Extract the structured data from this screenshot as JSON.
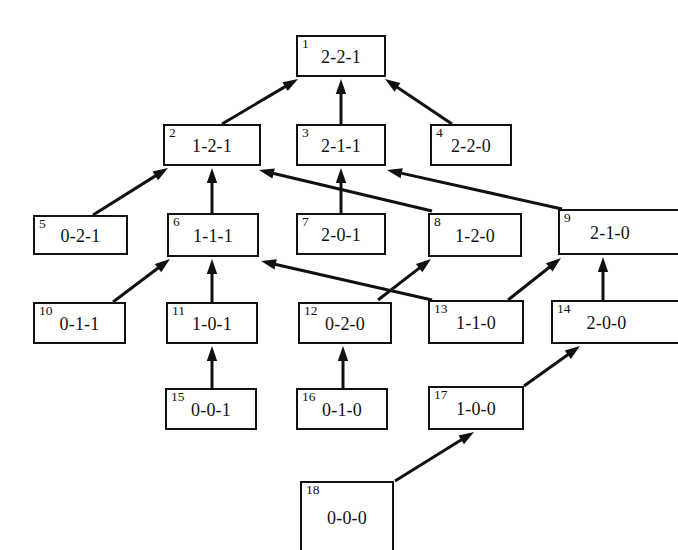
{
  "diagram": {
    "type": "directed-acyclic-graph",
    "node_colors": {
      "border": "#111111",
      "fill": "#ffffff",
      "text": "#111111"
    },
    "edge_color": "#111111",
    "nodes": [
      {
        "id": "1",
        "label": "2-2-1",
        "x": 296,
        "y": 35,
        "w": 90,
        "h": 42,
        "clip": ""
      },
      {
        "id": "2",
        "label": "1-2-1",
        "x": 163,
        "y": 124,
        "w": 98,
        "h": 42,
        "clip": ""
      },
      {
        "id": "3",
        "label": "2-1-1",
        "x": 296,
        "y": 124,
        "w": 90,
        "h": 42,
        "clip": ""
      },
      {
        "id": "4",
        "label": "2-2-0",
        "x": 430,
        "y": 124,
        "w": 82,
        "h": 42,
        "clip": ""
      },
      {
        "id": "5",
        "label": "0-2-1",
        "x": 33,
        "y": 215,
        "w": 95,
        "h": 40,
        "clip": ""
      },
      {
        "id": "6",
        "label": "1-1-1",
        "x": 167,
        "y": 213,
        "w": 92,
        "h": 44,
        "clip": ""
      },
      {
        "id": "7",
        "label": "2-0-1",
        "x": 296,
        "y": 213,
        "w": 90,
        "h": 42,
        "clip": ""
      },
      {
        "id": "8",
        "label": "1-2-0",
        "x": 428,
        "y": 213,
        "w": 94,
        "h": 44,
        "clip": ""
      },
      {
        "id": "9",
        "label": "2-1-0",
        "x": 558,
        "y": 209,
        "w": 120,
        "h": 46,
        "clip": "clip-right"
      },
      {
        "id": "10",
        "label": "0-1-1",
        "x": 33,
        "y": 302,
        "w": 93,
        "h": 42,
        "clip": ""
      },
      {
        "id": "11",
        "label": "1-0-1",
        "x": 166,
        "y": 302,
        "w": 92,
        "h": 42,
        "clip": ""
      },
      {
        "id": "12",
        "label": "0-2-0",
        "x": 298,
        "y": 302,
        "w": 94,
        "h": 42,
        "clip": ""
      },
      {
        "id": "13",
        "label": "1-1-0",
        "x": 428,
        "y": 300,
        "w": 96,
        "h": 44,
        "clip": ""
      },
      {
        "id": "14",
        "label": "2-0-0",
        "x": 551,
        "y": 300,
        "w": 127,
        "h": 44,
        "clip": "clip-right"
      },
      {
        "id": "15",
        "label": "0-0-1",
        "x": 165,
        "y": 388,
        "w": 92,
        "h": 42,
        "clip": ""
      },
      {
        "id": "16",
        "label": "0-1-0",
        "x": 296,
        "y": 388,
        "w": 92,
        "h": 42,
        "clip": ""
      },
      {
        "id": "17",
        "label": "1-0-0",
        "x": 428,
        "y": 386,
        "w": 96,
        "h": 44,
        "clip": ""
      },
      {
        "id": "18",
        "label": "0-0-0",
        "x": 300,
        "y": 481,
        "w": 94,
        "h": 69,
        "clip": "clip-bottom"
      }
    ],
    "edges": [
      {
        "from": "2",
        "to": "1",
        "x1": 222,
        "y1": 124,
        "x2": 298,
        "y2": 79
      },
      {
        "from": "3",
        "to": "1",
        "x1": 341,
        "y1": 124,
        "x2": 341,
        "y2": 79
      },
      {
        "from": "4",
        "to": "1",
        "x1": 452,
        "y1": 124,
        "x2": 385,
        "y2": 79
      },
      {
        "from": "5",
        "to": "2",
        "x1": 93,
        "y1": 215,
        "x2": 168,
        "y2": 168
      },
      {
        "from": "6",
        "to": "2",
        "x1": 212,
        "y1": 213,
        "x2": 212,
        "y2": 168
      },
      {
        "from": "8",
        "to": "2",
        "x1": 432,
        "y1": 211,
        "x2": 259,
        "y2": 170
      },
      {
        "from": "7",
        "to": "3",
        "x1": 341,
        "y1": 213,
        "x2": 341,
        "y2": 168
      },
      {
        "from": "9",
        "to": "3",
        "x1": 562,
        "y1": 209,
        "x2": 387,
        "y2": 170
      },
      {
        "from": "10",
        "to": "6",
        "x1": 113,
        "y1": 302,
        "x2": 170,
        "y2": 259
      },
      {
        "from": "11",
        "to": "6",
        "x1": 212,
        "y1": 302,
        "x2": 212,
        "y2": 259
      },
      {
        "from": "13",
        "to": "6",
        "x1": 432,
        "y1": 300,
        "x2": 261,
        "y2": 261
      },
      {
        "from": "12",
        "to": "8",
        "x1": 378,
        "y1": 300,
        "x2": 431,
        "y2": 259
      },
      {
        "from": "13",
        "to": "9",
        "x1": 508,
        "y1": 300,
        "x2": 561,
        "y2": 258
      },
      {
        "from": "14",
        "to": "9",
        "x1": 603,
        "y1": 300,
        "x2": 603,
        "y2": 257
      },
      {
        "from": "15",
        "to": "11",
        "x1": 212,
        "y1": 388,
        "x2": 212,
        "y2": 346
      },
      {
        "from": "16",
        "to": "12",
        "x1": 343,
        "y1": 388,
        "x2": 343,
        "y2": 346
      },
      {
        "from": "17",
        "to": "14",
        "x1": 524,
        "y1": 386,
        "x2": 580,
        "y2": 346
      },
      {
        "from": "18",
        "to": "17",
        "x1": 395,
        "y1": 481,
        "x2": 474,
        "y2": 432
      }
    ]
  }
}
